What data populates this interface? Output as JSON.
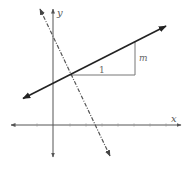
{
  "diagram": {
    "title": "",
    "axes": {
      "x_label": "x",
      "y_label": "y"
    },
    "labels": {
      "run": "1",
      "rise": "m"
    },
    "lines": [
      {
        "name": "solid-line",
        "style": "solid",
        "description": "line with positive slope m"
      },
      {
        "name": "dashed-line",
        "style": "dash-dot",
        "description": "line with negative slope (perpendicular)"
      }
    ],
    "slope_triangle": {
      "run_label": "1",
      "rise_label": "m"
    },
    "colors": {
      "axis": "#555555",
      "solid_line": "#222222",
      "dashed_line": "#555555",
      "triangle": "#777777"
    }
  }
}
